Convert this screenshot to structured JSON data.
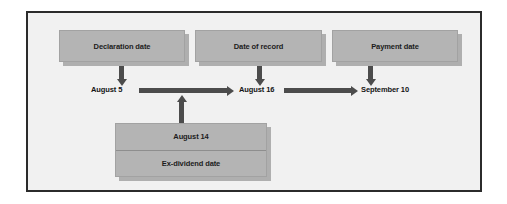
{
  "figure": {
    "frame_border_color": "#2b2b2b",
    "background_color": "#f1f1f1",
    "box_fill_color": "#b4b4b4",
    "arrow_color": "#4c4c4c"
  },
  "nodes": {
    "declaration": {
      "label": "Declaration date"
    },
    "record": {
      "label": "Date of record"
    },
    "payment": {
      "label": "Payment date"
    },
    "exdividend": {
      "date": "August 14",
      "label": "Ex-dividend date"
    }
  },
  "timeline": {
    "declaration_date": "August 5",
    "record_date": "August 16",
    "payment_date": "September 10"
  }
}
